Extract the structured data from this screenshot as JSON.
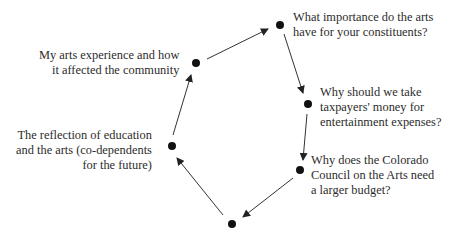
{
  "diagram": {
    "type": "cycle",
    "nodes": [
      {
        "id": "top",
        "text": "What importance do the arts\nhave for your constituents?"
      },
      {
        "id": "right-upper",
        "text": "Why should we take\ntaxpayers' money for\nentertainment expenses?"
      },
      {
        "id": "right-lower",
        "text": "Why does the Colorado\nCouncil on the Arts need\na larger budget?"
      },
      {
        "id": "bottom",
        "text": ""
      },
      {
        "id": "left",
        "text": "The reflection of education\nand the arts (co-dependents\nfor the future)"
      },
      {
        "id": "upper-left",
        "text": "My arts experience and how\nit affected the community"
      }
    ],
    "edges": [
      {
        "from": "upper-left",
        "to": "top"
      },
      {
        "from": "top",
        "to": "right-upper"
      },
      {
        "from": "right-upper",
        "to": "right-lower"
      },
      {
        "from": "right-lower",
        "to": "bottom"
      },
      {
        "from": "bottom",
        "to": "left"
      },
      {
        "from": "left",
        "to": "upper-left"
      }
    ],
    "colors": {
      "node": "#111111",
      "edge": "#333333",
      "text": "#2c2c2c"
    }
  }
}
